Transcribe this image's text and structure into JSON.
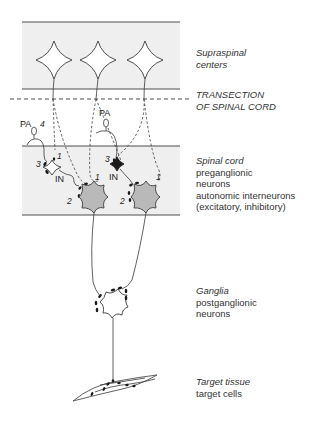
{
  "diagram": {
    "colors": {
      "band_fill": "#efefef",
      "line": "#3a3a3a",
      "neuron_fill": "#b9b9b9",
      "background": "#ffffff"
    },
    "labels": {
      "supraspinal": {
        "title": "Supraspinal",
        "subtitle": "centers"
      },
      "transection": {
        "line1": "TRANSECTION",
        "line2": "OF SPINAL CORD"
      },
      "spinal_cord": {
        "title": "Spinal cord",
        "lines": [
          "preganglionic",
          "neurons",
          "autonomic interneurons",
          "(excitatory, inhibitory)"
        ]
      },
      "ganglia": {
        "title": "Ganglia",
        "lines": [
          "postganglionic",
          "neurons"
        ]
      },
      "target": {
        "title": "Target tissue",
        "lines": [
          "target cells"
        ]
      }
    },
    "markers": {
      "pa_left": "PA",
      "pa_right": "PA",
      "in_left": "IN",
      "in_right": "IN",
      "n1": "1",
      "n2": "2",
      "n3": "3",
      "n4": "4"
    }
  }
}
